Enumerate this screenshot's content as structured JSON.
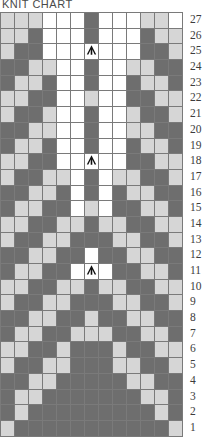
{
  "title": "KNIT CHART",
  "chart_data": {
    "type": "heatmap",
    "title": "KNIT CHART",
    "xlabel": "",
    "ylabel": "Row",
    "columns": 13,
    "rows": 27,
    "legend": [
      {
        "key": "D",
        "label": "dark stitch",
        "color": "#6e6e6e"
      },
      {
        "key": "L",
        "label": "light stitch",
        "color": "#d6d6d6"
      },
      {
        "key": "W",
        "label": "white stitch",
        "color": "#ffffff"
      }
    ],
    "row_numbers": [
      27,
      26,
      25,
      24,
      23,
      22,
      21,
      20,
      19,
      18,
      17,
      16,
      15,
      14,
      13,
      12,
      11,
      10,
      9,
      8,
      7,
      6,
      5,
      4,
      3,
      2,
      1
    ],
    "symbol": {
      "name": "central-double-decrease",
      "glyph": "peak-arrow",
      "rows": [
        25,
        18,
        11
      ],
      "column": 7
    },
    "grid": [
      {
        "row": 27,
        "cells": [
          "L",
          "L",
          "L",
          "W",
          "W",
          "W",
          "D",
          "W",
          "W",
          "W",
          "L",
          "L",
          "W"
        ]
      },
      {
        "row": 26,
        "cells": [
          "L",
          "L",
          "D",
          "W",
          "W",
          "W",
          "D",
          "W",
          "W",
          "W",
          "D",
          "L",
          "L"
        ]
      },
      {
        "row": 25,
        "cells": [
          "L",
          "D",
          "D",
          "W",
          "W",
          "W",
          "W",
          "W",
          "W",
          "W",
          "D",
          "D",
          "L"
        ]
      },
      {
        "row": 24,
        "cells": [
          "D",
          "D",
          "L",
          "L",
          "W",
          "W",
          "D",
          "W",
          "W",
          "L",
          "L",
          "D",
          "D"
        ]
      },
      {
        "row": 23,
        "cells": [
          "D",
          "L",
          "L",
          "D",
          "W",
          "W",
          "D",
          "W",
          "W",
          "D",
          "L",
          "L",
          "D"
        ]
      },
      {
        "row": 22,
        "cells": [
          "L",
          "L",
          "D",
          "D",
          "W",
          "W",
          "L",
          "W",
          "W",
          "D",
          "D",
          "L",
          "L"
        ]
      },
      {
        "row": 21,
        "cells": [
          "L",
          "D",
          "D",
          "L",
          "W",
          "W",
          "D",
          "W",
          "W",
          "L",
          "D",
          "D",
          "L"
        ]
      },
      {
        "row": 20,
        "cells": [
          "D",
          "D",
          "L",
          "L",
          "W",
          "W",
          "D",
          "W",
          "W",
          "L",
          "L",
          "D",
          "D"
        ]
      },
      {
        "row": 19,
        "cells": [
          "D",
          "L",
          "L",
          "D",
          "W",
          "W",
          "D",
          "W",
          "W",
          "D",
          "L",
          "L",
          "D"
        ]
      },
      {
        "row": 18,
        "cells": [
          "L",
          "L",
          "D",
          "D",
          "W",
          "W",
          "W",
          "W",
          "W",
          "D",
          "D",
          "L",
          "L"
        ]
      },
      {
        "row": 17,
        "cells": [
          "L",
          "D",
          "D",
          "L",
          "L",
          "W",
          "D",
          "W",
          "L",
          "L",
          "D",
          "D",
          "L"
        ]
      },
      {
        "row": 16,
        "cells": [
          "D",
          "D",
          "L",
          "L",
          "D",
          "W",
          "D",
          "W",
          "D",
          "L",
          "L",
          "D",
          "D"
        ]
      },
      {
        "row": 15,
        "cells": [
          "D",
          "L",
          "L",
          "D",
          "D",
          "W",
          "L",
          "W",
          "D",
          "D",
          "L",
          "L",
          "D"
        ]
      },
      {
        "row": 14,
        "cells": [
          "L",
          "L",
          "D",
          "D",
          "L",
          "L",
          "D",
          "L",
          "L",
          "D",
          "D",
          "L",
          "L"
        ]
      },
      {
        "row": 13,
        "cells": [
          "L",
          "D",
          "D",
          "L",
          "L",
          "D",
          "D",
          "D",
          "L",
          "L",
          "D",
          "D",
          "L"
        ]
      },
      {
        "row": 12,
        "cells": [
          "D",
          "D",
          "L",
          "L",
          "D",
          "D",
          "W",
          "D",
          "D",
          "L",
          "L",
          "D",
          "D"
        ]
      },
      {
        "row": 11,
        "cells": [
          "D",
          "L",
          "L",
          "D",
          "D",
          "W",
          "W",
          "W",
          "D",
          "D",
          "L",
          "L",
          "D"
        ]
      },
      {
        "row": 10,
        "cells": [
          "L",
          "L",
          "D",
          "D",
          "L",
          "L",
          "D",
          "L",
          "L",
          "D",
          "D",
          "L",
          "L"
        ]
      },
      {
        "row": 9,
        "cells": [
          "L",
          "D",
          "D",
          "L",
          "L",
          "D",
          "D",
          "D",
          "L",
          "L",
          "D",
          "D",
          "L"
        ]
      },
      {
        "row": 8,
        "cells": [
          "D",
          "D",
          "L",
          "L",
          "D",
          "D",
          "L",
          "D",
          "D",
          "L",
          "L",
          "D",
          "D"
        ]
      },
      {
        "row": 7,
        "cells": [
          "D",
          "L",
          "L",
          "D",
          "D",
          "L",
          "L",
          "L",
          "D",
          "D",
          "L",
          "L",
          "D"
        ]
      },
      {
        "row": 6,
        "cells": [
          "L",
          "L",
          "D",
          "D",
          "L",
          "D",
          "D",
          "D",
          "L",
          "D",
          "D",
          "L",
          "L"
        ]
      },
      {
        "row": 5,
        "cells": [
          "L",
          "D",
          "D",
          "L",
          "L",
          "D",
          "D",
          "D",
          "L",
          "L",
          "D",
          "D",
          "L"
        ]
      },
      {
        "row": 4,
        "cells": [
          "D",
          "D",
          "L",
          "L",
          "D",
          "D",
          "D",
          "D",
          "D",
          "L",
          "L",
          "D",
          "D"
        ]
      },
      {
        "row": 3,
        "cells": [
          "D",
          "L",
          "L",
          "D",
          "D",
          "D",
          "D",
          "D",
          "D",
          "D",
          "L",
          "L",
          "D"
        ]
      },
      {
        "row": 2,
        "cells": [
          "D",
          "L",
          "D",
          "D",
          "D",
          "D",
          "D",
          "D",
          "D",
          "D",
          "D",
          "L",
          "D"
        ]
      },
      {
        "row": 1,
        "cells": [
          "L",
          "D",
          "D",
          "D",
          "D",
          "D",
          "D",
          "D",
          "D",
          "D",
          "D",
          "D",
          "L"
        ]
      }
    ]
  }
}
